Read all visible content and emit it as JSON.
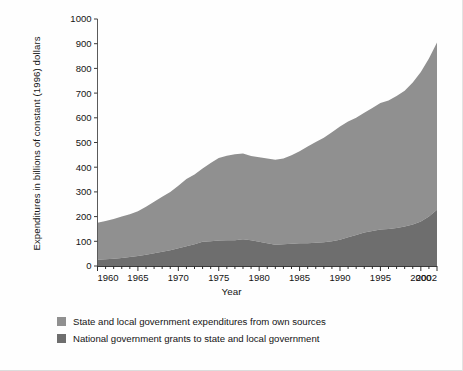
{
  "chart_data": {
    "type": "area",
    "title": "",
    "xlabel": "Year",
    "ylabel": "Expenditures in billions of constant (1996) dollars",
    "xlim": [
      1960,
      2002
    ],
    "ylim": [
      0,
      1000
    ],
    "grid": false,
    "stacked": true,
    "legend_position": "below",
    "y_ticks": [
      0,
      100,
      200,
      300,
      400,
      500,
      600,
      700,
      800,
      900,
      1000
    ],
    "x_ticks": [
      1960,
      1965,
      1970,
      1975,
      1980,
      1985,
      1990,
      1995,
      2000,
      2002
    ],
    "x_minor_tick_step": 1,
    "x": [
      1960,
      1961,
      1962,
      1963,
      1964,
      1965,
      1966,
      1967,
      1968,
      1969,
      1970,
      1971,
      1972,
      1973,
      1974,
      1975,
      1976,
      1977,
      1978,
      1979,
      1980,
      1981,
      1982,
      1983,
      1984,
      1985,
      1986,
      1987,
      1988,
      1989,
      1990,
      1991,
      1992,
      1993,
      1994,
      1995,
      1996,
      1997,
      1998,
      1999,
      2000,
      2001,
      2002
    ],
    "series": [
      {
        "name": "National government grants to state and local government",
        "color": "#6e6e6e",
        "order": "bottom",
        "values": [
          25,
          27,
          29,
          32,
          36,
          40,
          46,
          52,
          58,
          64,
          72,
          80,
          88,
          98,
          100,
          103,
          104,
          104,
          108,
          104,
          98,
          92,
          86,
          88,
          90,
          92,
          92,
          94,
          96,
          100,
          106,
          116,
          126,
          136,
          142,
          148,
          150,
          154,
          160,
          168,
          180,
          200,
          228
        ]
      },
      {
        "name": "State and local government expenditures from own sources",
        "color": "#909090",
        "order": "top",
        "values": [
          150,
          155,
          161,
          168,
          174,
          182,
          194,
          208,
          222,
          236,
          253,
          272,
          282,
          297,
          317,
          334,
          342,
          348,
          347,
          341,
          342,
          343,
          344,
          347,
          358,
          373,
          392,
          408,
          423,
          441,
          459,
          469,
          474,
          484,
          498,
          512,
          520,
          534,
          550,
          575,
          605,
          640,
          677
        ]
      }
    ],
    "totals": [
      175,
      182,
      190,
      200,
      210,
      222,
      240,
      260,
      280,
      300,
      325,
      352,
      370,
      395,
      417,
      437,
      446,
      452,
      455,
      445,
      440,
      435,
      430,
      435,
      448,
      465,
      484,
      502,
      519,
      541,
      565,
      585,
      600,
      620,
      640,
      660,
      670,
      688,
      710,
      743,
      785,
      840,
      905
    ]
  },
  "legend": {
    "items": [
      {
        "label": "State and local government expenditures from own sources",
        "color": "#909090"
      },
      {
        "label": "National government grants to state and local government",
        "color": "#6e6e6e"
      }
    ]
  },
  "axes": {
    "x_title": "Year",
    "y_title": "Expenditures in billions of constant (1996) dollars"
  }
}
